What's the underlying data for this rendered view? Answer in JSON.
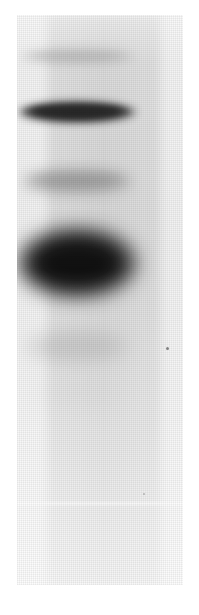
{
  "figure": {
    "kind": "gel-electrophoresis-autoradiograph",
    "caption": "",
    "width_px": 199,
    "height_px": 615,
    "background_color": "#ffffff",
    "film": {
      "x": 17,
      "y": 15,
      "width": 166,
      "height": 570,
      "color": "#f2f2f2"
    },
    "lane": {
      "label": "",
      "x": 43,
      "y": 15,
      "width": 122,
      "height": 570,
      "color": "#e2e2e2"
    },
    "seams": [
      {
        "name": "lower-scan-seam",
        "y": 487,
        "height": 3,
        "opacity": 0.85
      }
    ],
    "specks": [
      {
        "name": "dust-speck-right",
        "x": 149,
        "y": 332,
        "size": 3
      },
      {
        "name": "dust-speck-lower",
        "x": 126,
        "y": 478,
        "size": 2
      }
    ],
    "bands": [
      {
        "id": 1,
        "name": "band-1-faint-top",
        "intensity_label": "faint",
        "intensity": 0.3,
        "center_x": 60,
        "center_y": 41,
        "width": 118,
        "height": 17,
        "blur": 5,
        "color": "#8a8a8a",
        "curve": 2
      },
      {
        "id": 2,
        "name": "band-2-strong-upper",
        "intensity_label": "very strong",
        "intensity": 0.97,
        "center_x": 60,
        "center_y": 97,
        "width": 120,
        "height": 22,
        "blur": 4,
        "color": "#151515",
        "curve": 4
      },
      {
        "id": 3,
        "name": "band-3-medium-middle",
        "intensity_label": "medium",
        "intensity": 0.45,
        "center_x": 60,
        "center_y": 167,
        "width": 116,
        "height": 26,
        "blur": 7,
        "color": "#7a7a7a",
        "curve": 3
      },
      {
        "id": 4,
        "name": "band-4-strong-broad-lower",
        "intensity_label": "very strong, broad",
        "intensity": 1.0,
        "center_x": 60,
        "center_y": 248,
        "width": 124,
        "height": 74,
        "blur": 9,
        "color": "#101010",
        "curve": 0
      },
      {
        "id": 5,
        "name": "band-5-medium-bottom",
        "intensity_label": "medium-faint, diffuse",
        "intensity": 0.38,
        "center_x": 60,
        "center_y": 332,
        "width": 108,
        "height": 32,
        "blur": 9,
        "color": "#8f8f8f",
        "curve": 0
      },
      {
        "id": 6,
        "name": "band-6-very-faint-trail",
        "intensity_label": "very faint trail",
        "intensity": 0.15,
        "center_x": 60,
        "center_y": 378,
        "width": 96,
        "height": 34,
        "blur": 12,
        "color": "#b4b4b4",
        "curve": 0
      }
    ]
  }
}
